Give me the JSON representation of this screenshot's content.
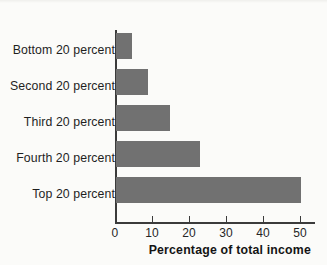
{
  "chart_data": {
    "type": "bar",
    "orientation": "horizontal",
    "title": "",
    "xlabel": "Percentage of total income",
    "ylabel": "",
    "categories": [
      "Bottom 20 percent",
      "Second 20 percent",
      "Third 20 percent",
      "Fourth 20 percent",
      "Top 20 percent"
    ],
    "values": [
      4.3,
      8.7,
      14.6,
      22.7,
      50.0
    ],
    "series": [
      {
        "name": "Percentage of total income",
        "values": [
          4.3,
          8.7,
          14.6,
          22.7,
          50.0
        ]
      }
    ],
    "xlim": [
      0,
      52
    ],
    "xticks": [
      0,
      10,
      20,
      30,
      40,
      50
    ],
    "xtick_labels": [
      "0",
      "10",
      "20",
      "30",
      "40",
      "50"
    ],
    "grid": false,
    "legend": false,
    "bar_color": "#717171",
    "axis_color": "#3b3b3b",
    "background_color": "#fbfbf9",
    "text_color": "#1f1f1f"
  },
  "axis": {
    "x_title": "Percentage of total income",
    "tick_labels": [
      "0",
      "10",
      "20",
      "30",
      "40",
      "50"
    ]
  },
  "categories": {
    "c0": "Bottom 20 percent",
    "c1": "Second 20 percent",
    "c2": "Third 20 percent",
    "c3": "Fourth 20 percent",
    "c4": "Top 20 percent"
  }
}
